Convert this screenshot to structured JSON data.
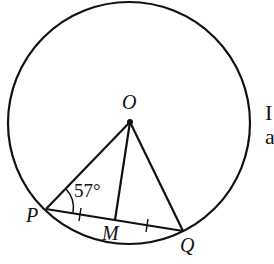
{
  "diagram": {
    "circle": {
      "cx": 129,
      "cy": 123,
      "r": 121
    },
    "points": {
      "O": {
        "label": "O",
        "x": 130,
        "y": 122
      },
      "P": {
        "label": "P",
        "x": 46,
        "y": 209
      },
      "Q": {
        "label": "Q",
        "x": 183,
        "y": 231
      },
      "M": {
        "label": "M",
        "x": 115,
        "y": 220
      }
    },
    "angle_label": "57°",
    "side_text": [
      "I",
      "a"
    ],
    "stroke_color": "#111111"
  }
}
